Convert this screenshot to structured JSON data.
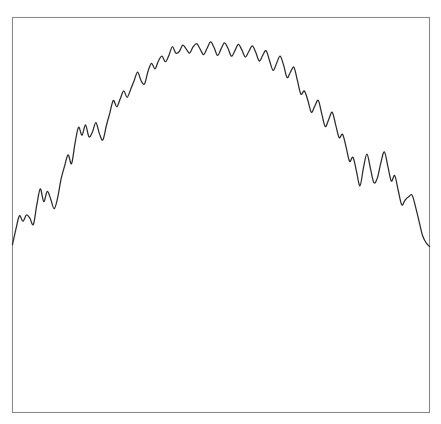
{
  "chart_data": {
    "type": "line",
    "title": "",
    "subtitle": "",
    "xlabel": "",
    "ylabel": "",
    "grid": false,
    "legend": null,
    "legend_position": "none",
    "axis_ticks_visible": false,
    "tick_labels_x": [],
    "tick_labels_y": [],
    "xlim": [
      0,
      120
    ],
    "ylim": [
      0,
      100
    ],
    "series": [
      {
        "name": "series-1",
        "color": "#2b2b2b",
        "x": [
          0,
          1,
          2,
          3,
          4,
          5,
          6,
          7,
          8,
          9,
          10,
          11,
          12,
          13,
          14,
          15,
          16,
          17,
          18,
          19,
          20,
          21,
          22,
          23,
          24,
          25,
          26,
          27,
          28,
          29,
          30,
          31,
          32,
          33,
          34,
          35,
          36,
          37,
          38,
          39,
          40,
          41,
          42,
          43,
          44,
          45,
          46,
          47,
          48,
          49,
          50,
          51,
          52,
          53,
          54,
          55,
          56,
          57,
          58,
          59,
          60,
          61,
          62,
          63,
          64,
          65,
          66,
          67,
          68,
          69,
          70,
          71,
          72,
          73,
          74,
          75,
          76,
          77,
          78,
          79,
          80,
          81,
          82,
          83,
          84,
          85,
          86,
          87,
          88,
          89,
          90,
          91,
          92,
          93,
          94,
          95,
          96,
          97,
          98,
          99,
          100,
          101,
          102,
          103,
          104,
          105,
          106,
          107,
          108,
          109,
          110,
          111,
          112,
          113,
          114,
          115,
          116,
          117,
          118,
          119,
          120
        ],
        "y": [
          42.5,
          46.5,
          49.8,
          48.4,
          50.0,
          49.2,
          47.6,
          52.6,
          56.6,
          53.4,
          56.0,
          54.0,
          51.6,
          54.4,
          59.2,
          62.4,
          65.2,
          63.0,
          68.2,
          72.2,
          70.2,
          72.8,
          69.8,
          71.0,
          73.4,
          70.6,
          69.0,
          72.6,
          75.8,
          79.0,
          77.4,
          79.4,
          81.4,
          79.8,
          81.8,
          84.0,
          86.2,
          84.0,
          83.2,
          86.4,
          88.4,
          87.0,
          89.0,
          90.2,
          88.8,
          90.4,
          92.6,
          91.0,
          91.4,
          93.0,
          92.0,
          91.0,
          92.6,
          93.4,
          92.0,
          90.6,
          92.2,
          93.8,
          92.4,
          90.4,
          92.0,
          93.6,
          92.2,
          90.2,
          91.6,
          93.2,
          91.8,
          90.0,
          91.4,
          92.8,
          91.2,
          89.0,
          90.4,
          91.6,
          89.0,
          86.6,
          88.4,
          90.2,
          88.0,
          84.8,
          86.2,
          87.4,
          84.0,
          80.6,
          81.4,
          79.0,
          76.0,
          77.6,
          79.0,
          75.6,
          72.4,
          74.2,
          76.0,
          72.8,
          69.6,
          70.4,
          67.2,
          63.6,
          64.6,
          61.0,
          57.4,
          62.0,
          65.4,
          61.8,
          58.2,
          59.4,
          63.2,
          66.0,
          62.4,
          58.6,
          60.0,
          56.2,
          52.6,
          53.8,
          54.6,
          55.0,
          52.0,
          48.4,
          44.8,
          43.0,
          42.0
        ]
      }
    ]
  },
  "frame": {
    "border_color": "#8a8a8a",
    "background_color": "#ffffff"
  },
  "canvas": {
    "width": 441,
    "height": 424,
    "background_color": "#ffffff"
  }
}
